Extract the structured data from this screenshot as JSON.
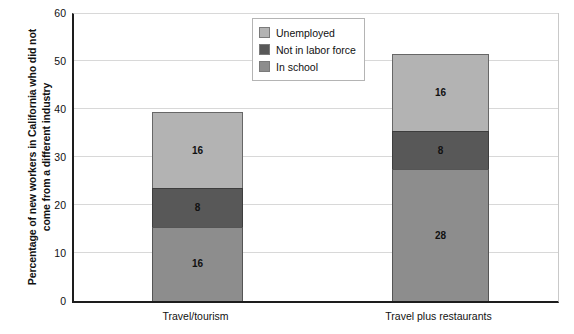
{
  "chart_data": {
    "type": "bar",
    "stacked": true,
    "title": "",
    "xlabel": "",
    "ylabel": "Percentage of new workers in California who did not come from a different industry",
    "ylabel_lines": [
      "Percentage of new workers in California who did not",
      "come from a different industry"
    ],
    "categories": [
      "Travel/tourism",
      "Travel plus restaurants"
    ],
    "series": [
      {
        "name": "In school",
        "values": [
          16,
          28
        ],
        "color": "#8d8d8d"
      },
      {
        "name": "Not in labor force",
        "values": [
          8,
          8
        ],
        "color": "#585858"
      },
      {
        "name": "Unemployed",
        "values": [
          16,
          16
        ],
        "color": "#b3b3b3"
      }
    ],
    "totals": [
      39.5,
      51.5
    ],
    "ylim": [
      0,
      60
    ],
    "yticks": [
      0,
      10,
      20,
      30,
      40,
      50,
      60
    ],
    "ytick_labels": [
      "0",
      "10",
      "20",
      "30",
      "40",
      "50",
      "60"
    ],
    "grid": true,
    "legend_position": "top-center-right",
    "legend_order": [
      "Unemployed",
      "Not in labor force",
      "In school"
    ]
  },
  "legend": {
    "items": [
      {
        "label": "Unemployed",
        "color": "#b3b3b3"
      },
      {
        "label": "Not in labor force",
        "color": "#585858"
      },
      {
        "label": "In school",
        "color": "#8d8d8d"
      }
    ]
  },
  "axis": {
    "y_labels": [
      "60",
      "50",
      "40",
      "30",
      "20",
      "10",
      "0"
    ],
    "x_labels": [
      "Travel/tourism",
      "Travel plus restaurants"
    ]
  },
  "bars": [
    {
      "category": "Travel/tourism",
      "segments": [
        {
          "name": "In school",
          "value": 16,
          "label": "16",
          "color": "#8d8d8d"
        },
        {
          "name": "Not in labor force",
          "value": 8,
          "label": "8",
          "color": "#585858"
        },
        {
          "name": "Unemployed",
          "value": 16,
          "label": "16",
          "color": "#b3b3b3"
        }
      ]
    },
    {
      "category": "Travel plus restaurants",
      "segments": [
        {
          "name": "In school",
          "value": 28,
          "label": "28",
          "color": "#8d8d8d"
        },
        {
          "name": "Not in labor force",
          "value": 8,
          "label": "8",
          "color": "#585858"
        },
        {
          "name": "Unemployed",
          "value": 16,
          "label": "16",
          "color": "#b3b3b3"
        }
      ]
    }
  ]
}
